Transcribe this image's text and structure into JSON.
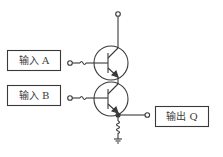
{
  "diagram": {
    "title": "",
    "type": "two-transistor series AND gate",
    "colors": {
      "line": "#3a3a3a",
      "background": "#ffffff"
    },
    "inputs": [
      {
        "label": "输入 A",
        "id": "A"
      },
      {
        "label": "输入 B",
        "id": "B"
      }
    ],
    "outputs": [
      {
        "label": "输出 Q",
        "id": "Q"
      }
    ],
    "components": [
      {
        "type": "npn-transistor",
        "name": "upper"
      },
      {
        "type": "npn-transistor",
        "name": "lower"
      },
      {
        "type": "resistor",
        "name": "emitter-load"
      },
      {
        "type": "ground",
        "name": "ground"
      },
      {
        "type": "terminal",
        "name": "supply"
      }
    ]
  }
}
